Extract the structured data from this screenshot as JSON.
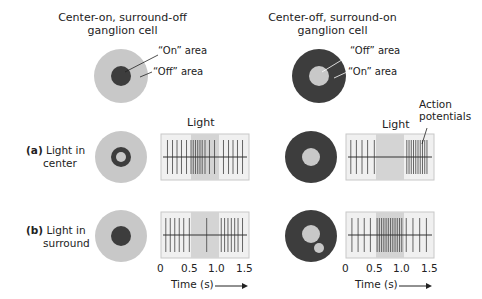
{
  "left": {
    "title_line1": "Center-on, surround-off",
    "title_line2": "ganglion cell",
    "on_area": "“On” area",
    "off_area": "“Off” area",
    "center_color": "#3d3d3d",
    "surround_color": "#c8c8c8"
  },
  "right": {
    "title_line1": "Center-off, surround-on",
    "title_line2": "ganglion cell",
    "off_area": "“Off” area",
    "on_area": "“On” area",
    "center_color": "#c8c8c8",
    "surround_color": "#3d3d3d"
  },
  "rows": {
    "a": {
      "letter": "(a)",
      "line1": "Light in",
      "line2": "center"
    },
    "b": {
      "letter": "(b)",
      "line1": "Light in",
      "line2": "surround"
    }
  },
  "labels": {
    "light_left": "Light",
    "light_right": "Light",
    "action_line1": "Action",
    "action_line2": "potentials",
    "time_label": "Time (s)",
    "arrow": "→"
  },
  "axis": {
    "ticks": [
      "0",
      "0.5",
      "1.0",
      "1.5"
    ]
  },
  "chart_data": [
    {
      "type": "scatter",
      "title": "Center-on cell, light in center",
      "xlabel": "Time (s)",
      "xlim": [
        0,
        1.5
      ],
      "light_period": [
        0.5,
        1.0
      ],
      "spike_times": [
        0.08,
        0.17,
        0.25,
        0.33,
        0.42,
        0.5,
        0.54,
        0.58,
        0.62,
        0.66,
        0.7,
        0.75,
        0.83,
        0.92,
        1.08,
        1.17,
        1.25,
        1.33,
        1.42
      ]
    },
    {
      "type": "scatter",
      "title": "Center-off cell, light in center",
      "xlabel": "Time (s)",
      "xlim": [
        0,
        1.5
      ],
      "light_period": [
        0.5,
        1.0
      ],
      "spike_times": [
        0.05,
        0.15,
        0.25,
        0.35,
        0.47,
        1.05,
        1.09,
        1.13,
        1.17,
        1.21,
        1.25,
        1.29,
        1.33,
        1.37,
        1.41
      ]
    },
    {
      "type": "scatter",
      "title": "Center-on cell, light in surround",
      "xlabel": "Time (s)",
      "xlim": [
        0,
        1.5
      ],
      "light_period": [
        0.5,
        1.0
      ],
      "spike_times": [
        0.05,
        0.13,
        0.21,
        0.29,
        0.37,
        0.47,
        0.78,
        1.04,
        1.1,
        1.16,
        1.22,
        1.28,
        1.34,
        1.42
      ]
    },
    {
      "type": "scatter",
      "title": "Center-off cell, light in surround",
      "xlabel": "Time (s)",
      "xlim": [
        0,
        1.5
      ],
      "light_period": [
        0.5,
        1.0
      ],
      "spike_times": [
        0.07,
        0.18,
        0.29,
        0.4,
        0.52,
        0.56,
        0.6,
        0.64,
        0.68,
        0.72,
        0.76,
        0.8,
        0.84,
        0.88,
        0.92,
        0.96,
        1.04,
        1.16,
        1.28,
        1.4
      ]
    }
  ]
}
